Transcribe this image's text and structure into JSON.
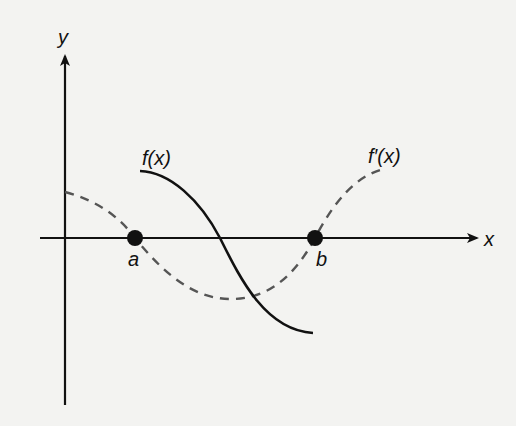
{
  "diagram": {
    "type": "function-graph",
    "background": "#f3f3f1",
    "ink": "#111111",
    "dash_color": "#555555",
    "axes": {
      "x_label": "x",
      "y_label": "y",
      "origin_px": [
        65,
        238
      ]
    },
    "points": [
      {
        "label": "a",
        "px": [
          135,
          238
        ]
      },
      {
        "label": "b",
        "px": [
          315,
          238
        ]
      }
    ],
    "curves": [
      {
        "name": "f(x)",
        "label": "f(x)",
        "style": "solid",
        "description": "decreasing curve from above axis near a to below axis near b, crossing x-axis midway between a and b"
      },
      {
        "name": "f'(x)",
        "label": "f′(x)",
        "style": "dashed",
        "description": "derivative: positive at y-axis, zero at a, minimum between a and b, zero at b, positive after b"
      }
    ]
  }
}
